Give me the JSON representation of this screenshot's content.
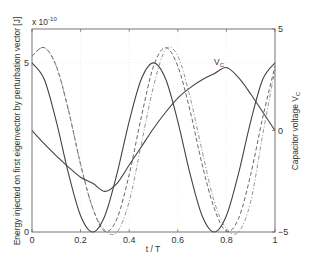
{
  "chart_data": {
    "type": "line",
    "title": "",
    "xlabel": "t / T",
    "ylabel": "Energy injected on first eigenvector by perturbation vector [J]",
    "ylabel_right": "Capacitor voltage V_C",
    "y_multiplier": "x 10^-10",
    "xlim": [
      0,
      1
    ],
    "ylim": [
      0,
      6
    ],
    "ylim_right": [
      -5,
      5
    ],
    "x_ticks": [
      "0",
      "0.2",
      "0.4",
      "0.6",
      "0.8",
      "1"
    ],
    "y_ticks_left": [
      "0",
      "5"
    ],
    "y_ticks_right": [
      "-5",
      "0",
      "5"
    ],
    "grid": true,
    "annotations": [
      {
        "text": "V_C",
        "x": 0.77,
        "y_right": 3.5
      }
    ],
    "x": [
      0,
      0.05,
      0.1,
      0.15,
      0.2,
      0.25,
      0.3,
      0.35,
      0.4,
      0.45,
      0.5,
      0.55,
      0.6,
      0.65,
      0.7,
      0.75,
      0.8,
      0.85,
      0.9,
      0.95,
      1.0
    ],
    "series": [
      {
        "name": "Energy (solid)",
        "axis": "left",
        "style": "solid",
        "values": [
          5.0,
          4.52,
          3.27,
          1.73,
          0.48,
          0.0,
          0.48,
          1.73,
          3.27,
          4.52,
          5.0,
          4.52,
          3.27,
          1.73,
          0.48,
          0.0,
          0.48,
          1.73,
          3.27,
          4.52,
          5.0
        ]
      },
      {
        "name": "Energy (dashed)",
        "axis": "left",
        "style": "dashed",
        "values": [
          5.2,
          5.45,
          4.9,
          3.6,
          2.0,
          0.7,
          0.02,
          0.4,
          1.7,
          3.4,
          4.9,
          5.45,
          4.9,
          3.6,
          2.0,
          0.7,
          0.02,
          0.4,
          1.7,
          3.4,
          4.9
        ]
      },
      {
        "name": "Energy (dash-dot)",
        "axis": "left",
        "style": "dashdot",
        "values": [
          5.2,
          5.45,
          4.9,
          3.6,
          2.0,
          0.7,
          0.05,
          0.0,
          0.9,
          2.6,
          4.3,
          5.4,
          5.2,
          4.0,
          2.4,
          0.9,
          0.1,
          0.0,
          0.9,
          2.9,
          4.8
        ]
      },
      {
        "name": "V_C",
        "axis": "right",
        "style": "solid",
        "values": [
          0.0,
          -0.65,
          -1.25,
          -1.8,
          -2.3,
          -2.6,
          -3.0,
          -2.6,
          -1.7,
          -0.8,
          0.1,
          0.9,
          1.6,
          2.1,
          2.5,
          2.8,
          3.1,
          2.6,
          1.8,
          0.9,
          0.0
        ]
      }
    ]
  },
  "labels": {
    "multiplier": "x 10",
    "multiplier_exp": "-10",
    "xlabel": "t / T",
    "ylabel_left": "Energy injected on first eigenvector by perturbation vector [J]",
    "ylabel_right_main": "Capacitor voltage V",
    "ylabel_right_sub": "C",
    "vc_main": "V",
    "vc_sub": "C"
  }
}
